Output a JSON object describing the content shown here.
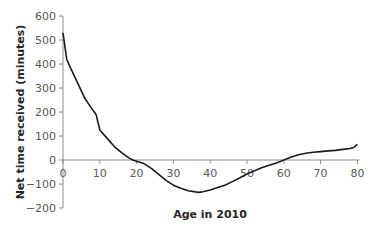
{
  "chart_data": {
    "type": "line",
    "title": "",
    "xlabel": "Age in 2010",
    "ylabel": "Net time received (minutes)",
    "xlim": [
      0,
      80
    ],
    "ylim": [
      -200,
      600
    ],
    "x_ticks": [
      0,
      10,
      20,
      30,
      40,
      50,
      60,
      70,
      80
    ],
    "y_ticks": [
      -200,
      -100,
      0,
      100,
      200,
      300,
      400,
      500,
      600
    ],
    "grid": false,
    "legend": null,
    "series": [
      {
        "name": "Net time received",
        "color": "#1a1a1a",
        "x": [
          0,
          1,
          2,
          4,
          6,
          8,
          9,
          10,
          12,
          14,
          16,
          18,
          19,
          20,
          22,
          24,
          26,
          28,
          30,
          32,
          34,
          36,
          37,
          38,
          40,
          42,
          44,
          46,
          48,
          50,
          52,
          54,
          56,
          58,
          60,
          62,
          64,
          66,
          68,
          70,
          72,
          74,
          76,
          78,
          79,
          80
        ],
        "y": [
          530,
          420,
          385,
          320,
          255,
          210,
          190,
          125,
          90,
          55,
          30,
          8,
          0,
          -5,
          -15,
          -35,
          -60,
          -85,
          -105,
          -118,
          -128,
          -133,
          -135,
          -132,
          -125,
          -115,
          -105,
          -90,
          -75,
          -58,
          -45,
          -32,
          -22,
          -12,
          0,
          12,
          22,
          28,
          32,
          35,
          38,
          40,
          44,
          48,
          52,
          65
        ]
      }
    ]
  }
}
